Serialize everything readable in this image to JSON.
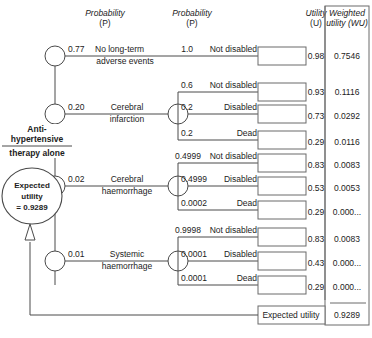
{
  "headers": {
    "prob1_line1": "Probability",
    "prob1_line2": "(P)",
    "prob2_line1": "Probability",
    "prob2_line2": "(P)",
    "utility_line1": "Utility",
    "utility_line2": "(U)",
    "wu_line1": "Weighted",
    "wu_line2": "utility (WU)"
  },
  "strategy": {
    "line1": "Anti-",
    "line2": "hypertensive",
    "line3": "therapy alone"
  },
  "expected_utility_node": {
    "line1": "Expected",
    "line2": "utility",
    "line3": "= 0.9289"
  },
  "total": {
    "label": "Expected utility",
    "value": "0.9289"
  },
  "branches": [
    {
      "prob": "0.77",
      "label_line1": "No long-term",
      "label_line2": "adverse events",
      "outcomes": [
        {
          "prob": "1.0",
          "name": "Not disabled",
          "utility": "0.98",
          "wu": "0.7546"
        }
      ]
    },
    {
      "prob": "0.20",
      "label_line1": "Cerebral",
      "label_line2": "infarction",
      "outcomes": [
        {
          "prob": "0.6",
          "name": "Not disabled",
          "utility": "0.93",
          "wu": "0.1116"
        },
        {
          "prob": "0.2",
          "name": "Disabled",
          "utility": "0.73",
          "wu": "0.0292"
        },
        {
          "prob": "0.2",
          "name": "Dead",
          "utility": "0.29",
          "wu": "0.0116"
        }
      ]
    },
    {
      "prob": "0.02",
      "label_line1": "Cerebral",
      "label_line2": "haemorrhage",
      "outcomes": [
        {
          "prob": "0.4999",
          "name": "Not disabled",
          "utility": "0.83",
          "wu": "0.0083"
        },
        {
          "prob": "0.4999",
          "name": "Disabled",
          "utility": "0.53",
          "wu": "0.0053"
        },
        {
          "prob": "0.0002",
          "name": "Dead",
          "utility": "0.29",
          "wu": "0.000..."
        }
      ]
    },
    {
      "prob": "0.01",
      "label_line1": "Systemic",
      "label_line2": "haemorrhage",
      "outcomes": [
        {
          "prob": "0.9998",
          "name": "Not disabled",
          "utility": "0.83",
          "wu": "0.0083"
        },
        {
          "prob": "0.0001",
          "name": "Disabled",
          "utility": "0.43",
          "wu": "0.000..."
        },
        {
          "prob": "0.0001",
          "name": "Dead",
          "utility": "0.29",
          "wu": "0.000..."
        }
      ]
    }
  ],
  "rows": [
    {
      "idx": 0,
      "branch": 0,
      "out": 0,
      "y": 56
    },
    {
      "idx": 1,
      "branch": 1,
      "out": 0,
      "y": 92
    },
    {
      "idx": 2,
      "branch": 1,
      "out": 1,
      "y": 114
    },
    {
      "idx": 3,
      "branch": 1,
      "out": 2,
      "y": 140
    },
    {
      "idx": 4,
      "branch": 2,
      "out": 0,
      "y": 163
    },
    {
      "idx": 5,
      "branch": 2,
      "out": 1,
      "y": 186
    },
    {
      "idx": 6,
      "branch": 2,
      "out": 2,
      "y": 210
    },
    {
      "idx": 7,
      "branch": 3,
      "out": 0,
      "y": 237
    },
    {
      "idx": 8,
      "branch": 3,
      "out": 1,
      "y": 261
    },
    {
      "idx": 9,
      "branch": 3,
      "out": 2,
      "y": 285
    }
  ],
  "colors": {
    "line": "#4a4a4a",
    "text": "#1c1c1c",
    "background": "#ffffff"
  }
}
